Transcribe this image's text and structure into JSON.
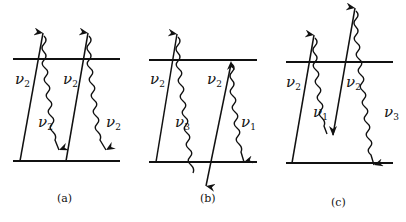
{
  "figure": {
    "panels": [
      {
        "id": "a",
        "caption": "(a)",
        "upper_level_label": "",
        "labels": [
          {
            "text": "ν",
            "sub": "2",
            "x": 15,
            "y": 84
          },
          {
            "text": "ν",
            "sub": "2",
            "x": 63,
            "y": 84
          },
          {
            "text": "ν",
            "sub": "2",
            "x": 38,
            "y": 127
          },
          {
            "text": "ν",
            "sub": "2",
            "x": 106,
            "y": 127
          }
        ]
      },
      {
        "id": "b",
        "caption": "(b)",
        "labels": [
          {
            "text": "ν",
            "sub": "2",
            "x": 150,
            "y": 84
          },
          {
            "text": "ν",
            "sub": "2",
            "x": 207,
            "y": 84
          },
          {
            "text": "ν",
            "sub": "3",
            "x": 175,
            "y": 127
          },
          {
            "text": "ν",
            "sub": "1",
            "x": 241,
            "y": 127
          }
        ]
      },
      {
        "id": "c",
        "caption": "(c)",
        "labels": [
          {
            "text": "ν",
            "sub": "2",
            "x": 286,
            "y": 87
          },
          {
            "text": "ν",
            "sub": "2",
            "x": 346,
            "y": 87
          },
          {
            "text": "ν",
            "sub": "1",
            "x": 313,
            "y": 117
          },
          {
            "text": "ν",
            "sub": "3",
            "x": 384,
            "y": 117
          }
        ]
      }
    ],
    "legend": {
      "straight_arrow": "pump photon",
      "wavy_arrow": "emitted photon"
    }
  }
}
